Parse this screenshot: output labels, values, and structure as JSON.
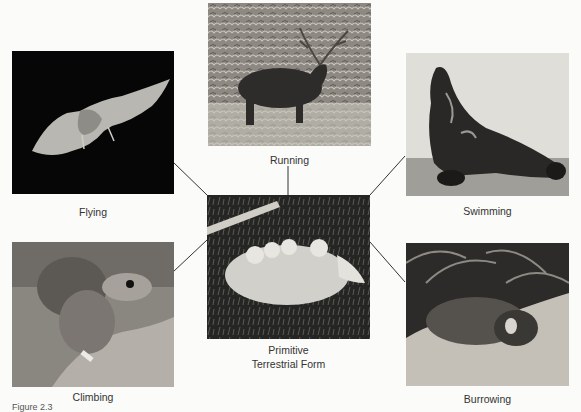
{
  "figure": {
    "caption": "Figure 2.3",
    "center": {
      "label_line1": "Primitive",
      "label_line2": "Terrestrial Form",
      "subject": "opossum carrying young"
    },
    "panels": [
      {
        "id": "flying",
        "label": "Flying",
        "subject": "bat in flight"
      },
      {
        "id": "running",
        "label": "Running",
        "subject": "red deer stag"
      },
      {
        "id": "swimming",
        "label": "Swimming",
        "subject": "sea lion"
      },
      {
        "id": "climbing",
        "label": "Climbing",
        "subject": "squirrel"
      },
      {
        "id": "burrowing",
        "label": "Burrowing",
        "subject": "mole"
      }
    ]
  }
}
